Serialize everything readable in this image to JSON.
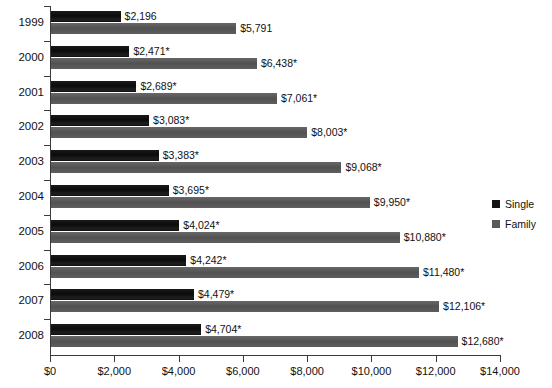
{
  "chart_data": {
    "type": "bar",
    "orientation": "horizontal",
    "title": "",
    "subtitle": "",
    "xlabel": "",
    "ylabel": "",
    "xlim": [
      0,
      14000
    ],
    "grid": false,
    "legend_position": "right",
    "categories": [
      "1999",
      "2000",
      "2001",
      "2002",
      "2003",
      "2004",
      "2005",
      "2006",
      "2007",
      "2008"
    ],
    "xticks": [
      0,
      2000,
      4000,
      6000,
      8000,
      10000,
      12000,
      14000
    ],
    "xtick_labels": [
      "$0",
      "$2,000",
      "$4,000",
      "$6,000",
      "$8,000",
      "$10,000",
      "$12,000",
      "$14,000"
    ],
    "series": [
      {
        "name": "Single",
        "color": "#141414",
        "values": [
          2196,
          2471,
          2689,
          3083,
          3383,
          3695,
          4024,
          4242,
          4479,
          4704
        ],
        "labels": [
          "$2,196",
          "$2,471*",
          "$2,689*",
          "$3,083*",
          "$3,383*",
          "$3,695*",
          "$4,024*",
          "$4,242*",
          "$4,479*",
          "$4,704*"
        ]
      },
      {
        "name": "Family",
        "color": "#5a5a5a",
        "values": [
          5791,
          6438,
          7061,
          8003,
          9068,
          9950,
          10880,
          11480,
          12106,
          12680
        ],
        "labels": [
          "$5,791",
          "$6,438*",
          "$7,061*",
          "$8,003*",
          "$9,068*",
          "$9,950*",
          "$10,880*",
          "$11,480*",
          "$12,106*",
          "$12,680*"
        ]
      }
    ]
  },
  "legend": {
    "items": [
      {
        "label": "Single",
        "color": "#141414"
      },
      {
        "label": "Family",
        "color": "#5a5a5a"
      }
    ]
  }
}
